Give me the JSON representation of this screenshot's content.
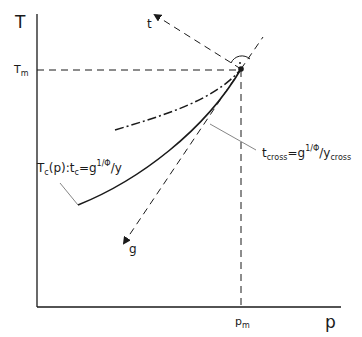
{
  "axes": {
    "y_label": "T",
    "x_label": "p",
    "y_tick_main": "T",
    "y_tick_sub": "m",
    "x_tick_main": "p",
    "x_tick_sub": "m"
  },
  "vectors": {
    "t_label": "t",
    "g_label": "g"
  },
  "curves": {
    "tc_label": {
      "pre": "T",
      "pre_sub": "c",
      "mid": "(p):t",
      "mid_sub": "c",
      "eq": "=g",
      "exp": "1/Φ",
      "post": "/y"
    },
    "tcross_label": {
      "pre": "t",
      "pre_sub": "cross",
      "eq": "=g",
      "exp": "1/Φ",
      "mid": "/y",
      "post_sub": "cross"
    }
  },
  "colors": {
    "ink": "#1a1a1a",
    "leader": "#666666",
    "background": "#ffffff"
  }
}
